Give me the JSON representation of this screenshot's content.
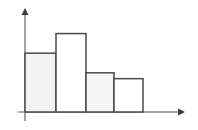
{
  "chart_data": {
    "type": "bar",
    "title": "",
    "subtitle": "",
    "xlabel": "",
    "ylabel": "",
    "categories": [
      "1",
      "2",
      "3",
      "4"
    ],
    "values": [
      60,
      80,
      40,
      34
    ],
    "xlim": [
      0,
      158
    ],
    "ylim": [
      0,
      102
    ],
    "grid": false,
    "legend": null,
    "tick_labels": {
      "x": [],
      "y": []
    },
    "annotations": [],
    "bars": [
      {
        "name": "bar-1",
        "x0": 25,
        "x1": 56,
        "value": 60,
        "fill": "#f2f2f2",
        "stroke": "#4a4a4a"
      },
      {
        "name": "bar-2",
        "x0": 56,
        "x1": 86,
        "value": 80,
        "fill": "#ffffff",
        "stroke": "#4a4a4a"
      },
      {
        "name": "bar-3",
        "x0": 86,
        "x1": 114,
        "value": 40,
        "fill": "#f4f4f4",
        "stroke": "#4a4a4a"
      },
      {
        "name": "bar-4",
        "x0": 114,
        "x1": 143,
        "value": 34,
        "fill": "#ffffff",
        "stroke": "#4a4a4a"
      }
    ]
  },
  "axes": {
    "baseline_y": 112,
    "origin_x": 25,
    "x_axis_start": 18,
    "x_axis_end": 183,
    "y_axis_top": 12,
    "y_axis_bottom": 120,
    "axis_color": "#8a8a8a",
    "arrow_color": "#3a3a3a"
  },
  "colors": {
    "background": "#ffffff",
    "bar_outline": "#4a4a4a",
    "bar_fill_shaded": "#f2f2f2",
    "bar_fill_empty": "#ffffff",
    "axis": "#8a8a8a"
  }
}
